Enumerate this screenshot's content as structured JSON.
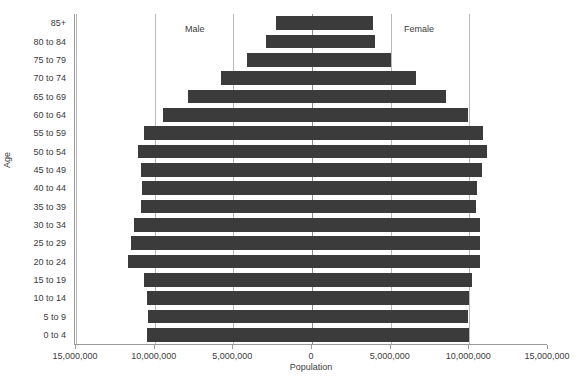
{
  "chart_data": {
    "type": "bar",
    "subtype": "population-pyramid",
    "title": "",
    "xlabel": "Population",
    "ylabel": "Age",
    "categories": [
      "0 to 4",
      "5 to 9",
      "10 to 14",
      "15 to 19",
      "20 to 24",
      "25 to 29",
      "30 to 34",
      "35 to 39",
      "40 to 44",
      "45 to 49",
      "50 to 54",
      "55 to 59",
      "60 to 64",
      "65 to 69",
      "70 to 74",
      "75 to 79",
      "80 to 84",
      "85+"
    ],
    "series": [
      {
        "name": "Male",
        "side": "left",
        "values": [
          10500000,
          10400000,
          10500000,
          10700000,
          11700000,
          11500000,
          11300000,
          10900000,
          10800000,
          10900000,
          11050000,
          10700000,
          9500000,
          7900000,
          5800000,
          4100000,
          2900000,
          2300000
        ]
      },
      {
        "name": "Female",
        "side": "right",
        "values": [
          10000000,
          9900000,
          10000000,
          10200000,
          10700000,
          10700000,
          10700000,
          10400000,
          10500000,
          10800000,
          11100000,
          10900000,
          9900000,
          8500000,
          6600000,
          5000000,
          4000000,
          3900000
        ]
      }
    ],
    "x_ticks": [
      {
        "label": "15,000,000",
        "value": -15000000
      },
      {
        "label": "10,000,000",
        "value": -10000000
      },
      {
        "label": "5,000,000",
        "value": -5000000
      },
      {
        "label": "0",
        "value": 0
      },
      {
        "label": "5,000,000",
        "value": 5000000
      },
      {
        "label": "10,000,000",
        "value": 10000000
      },
      {
        "label": "15,000,000",
        "value": 15000000
      }
    ],
    "xlim": [
      -15000000,
      15000000
    ],
    "grid": true,
    "legend": "none",
    "annotations": [
      {
        "text": "Male",
        "side": "left"
      },
      {
        "text": "Female",
        "side": "right"
      }
    ],
    "colors": {
      "bar": "#3b3b3b",
      "grid": "#b9b9b9",
      "axis": "#9a9a9a",
      "text": "#3b3b3b",
      "background": "#ffffff"
    }
  }
}
